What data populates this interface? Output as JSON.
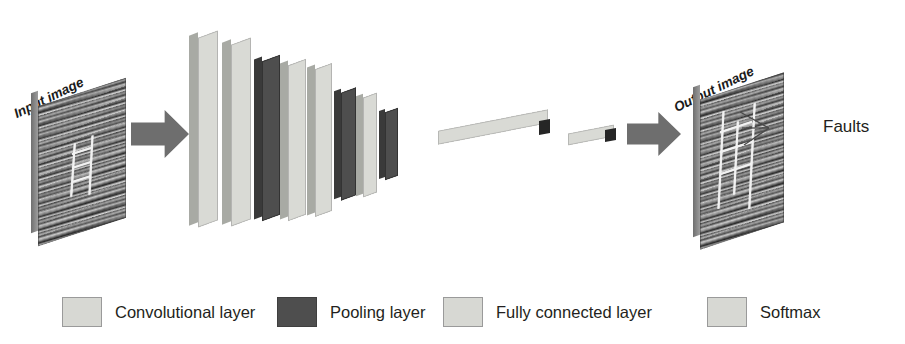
{
  "figure": {
    "type": "cnn-architecture-diagram",
    "input": {
      "title": "Input image",
      "icon": "seismic-section-image"
    },
    "output": {
      "title": "Output image",
      "icon": "seismic-section-image",
      "annotation": "Faults",
      "leader_lines": 3
    },
    "arrows": [
      {
        "name": "input-to-network"
      },
      {
        "name": "network-to-output"
      }
    ],
    "network": {
      "slabs": [
        {
          "kind": "conv",
          "x": 198,
          "y": 34,
          "w": 20,
          "h": 190,
          "edge": 9
        },
        {
          "kind": "conv",
          "x": 231,
          "y": 41,
          "w": 20,
          "h": 182,
          "edge": 9
        },
        {
          "kind": "pool",
          "x": 262,
          "y": 58,
          "w": 18,
          "h": 160,
          "edge": 8
        },
        {
          "kind": "conv",
          "x": 288,
          "y": 62,
          "w": 18,
          "h": 156,
          "edge": 8
        },
        {
          "kind": "conv",
          "x": 315,
          "y": 66,
          "w": 17,
          "h": 148,
          "edge": 8
        },
        {
          "kind": "pool",
          "x": 341,
          "y": 90,
          "w": 15,
          "h": 108,
          "edge": 7
        },
        {
          "kind": "conv",
          "x": 363,
          "y": 95,
          "w": 14,
          "h": 100,
          "edge": 7
        },
        {
          "kind": "pool",
          "x": 385,
          "y": 110,
          "w": 13,
          "h": 68,
          "edge": 6
        }
      ],
      "fc_bars": [
        {
          "x": 438,
          "y": 120,
          "w": 110,
          "h": 14
        },
        {
          "x": 568,
          "y": 129,
          "w": 46,
          "h": 12
        }
      ]
    },
    "legend": {
      "items": [
        {
          "label": "Convolutional layer",
          "swatch": "light",
          "left": 62,
          "text_left": 0
        },
        {
          "label": "Pooling layer",
          "swatch": "dark",
          "left": 277,
          "text_left": 0
        },
        {
          "label": "Fully connected layer",
          "swatch": "light",
          "left": 443,
          "text_left": 0
        },
        {
          "label": "Softmax",
          "swatch": "light",
          "left": 707,
          "text_left": 0
        }
      ]
    },
    "colors": {
      "conv": "#d9dad5",
      "pool": "#4e4e4e",
      "arrow": "#6e6e6e",
      "text": "#231f20",
      "seismic_base": "#8e8e8e"
    }
  }
}
